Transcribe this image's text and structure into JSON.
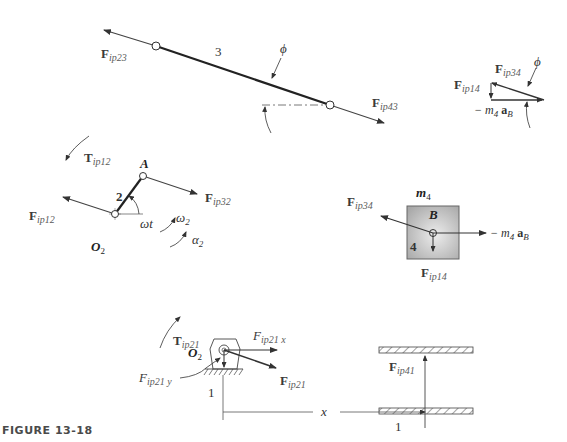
{
  "figure": {
    "caption": "FIGURE 13-18"
  },
  "link3": {
    "number": "3",
    "angle_label": "ϕ",
    "forces": {
      "Fip23": {
        "main": "F",
        "sub": "ip23"
      },
      "Fip43": {
        "main": "F",
        "sub": "ip43"
      }
    }
  },
  "force_triangle": {
    "angle_label": "ϕ",
    "Fip34": {
      "main": "F",
      "sub": "ip34"
    },
    "Fip14": {
      "main": "F",
      "sub": "ip14"
    },
    "inertia": {
      "prefix": "− m",
      "m_sub": "4",
      "a": "a",
      "a_sub": "B"
    }
  },
  "link2": {
    "number": "2",
    "pin_A": "A",
    "pivot": {
      "main": "O",
      "sub": "2"
    },
    "angle_label": "ωt",
    "omega": {
      "main": "ω",
      "sub": "2"
    },
    "alpha": {
      "main": "α",
      "sub": "2"
    },
    "torque": {
      "main": "T",
      "sub": "ip12"
    },
    "Fip12": {
      "main": "F",
      "sub": "ip12"
    },
    "Fip32": {
      "main": "F",
      "sub": "ip32"
    }
  },
  "slider4": {
    "number": "4",
    "mass": {
      "main": "m",
      "sub": "4"
    },
    "point": "B",
    "Fip34": {
      "main": "F",
      "sub": "ip34"
    },
    "Fip14": {
      "main": "F",
      "sub": "ip14"
    },
    "inertia": {
      "prefix": "− m",
      "m_sub": "4",
      "a": "a",
      "a_sub": "B"
    },
    "fill_color": "#b4b4b4"
  },
  "ground": {
    "number_left": "1",
    "number_right": "1",
    "pivot": {
      "main": "O",
      "sub": "2"
    },
    "torque": {
      "main": "T",
      "sub": "ip21"
    },
    "Fip21x": {
      "main": "F",
      "sub": "ip21 x"
    },
    "Fip21y": {
      "main": "F",
      "sub": "ip21 y"
    },
    "Fip21": {
      "main": "F",
      "sub": "ip21"
    },
    "Fip41": {
      "main": "F",
      "sub": "ip41"
    },
    "x_label": "x"
  }
}
